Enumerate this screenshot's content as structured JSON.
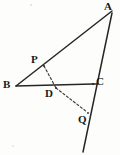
{
  "figure": {
    "kind": "geometry-diagram",
    "caption": "",
    "background_color": "#fdfdfb",
    "stroke_color": "#262626",
    "dash_color": "#3a3a3a",
    "width": 120,
    "height": 155,
    "labels": {
      "a": "A",
      "b": "B",
      "c": "C",
      "p": "P",
      "d": "D",
      "q": "Q"
    },
    "points": [
      {
        "name": "A",
        "label": "A",
        "x": 112,
        "y": 11,
        "label_x": 104,
        "label_y": 2,
        "on": "apex of triangle"
      },
      {
        "name": "B",
        "label": "B",
        "x": 16,
        "y": 86,
        "label_x": 3,
        "label_y": 79,
        "on": "left vertex of triangle"
      },
      {
        "name": "C",
        "label": "C",
        "x": 93,
        "y": 84,
        "label_x": 96,
        "label_y": 76,
        "on": "right vertex of triangle"
      },
      {
        "name": "P",
        "label": "P",
        "x": 44,
        "y": 66,
        "label_x": 30,
        "label_y": 54,
        "on": "segment AB"
      },
      {
        "name": "D",
        "label": "D",
        "x": 56,
        "y": 88,
        "label_x": 44,
        "label_y": 87,
        "on": "segment BC"
      },
      {
        "name": "Q",
        "label": "Q",
        "x": 88,
        "y": 113,
        "label_x": 78,
        "label_y": 114,
        "on": "line AC extended"
      }
    ],
    "segments": [
      {
        "name": "BA",
        "from": "B",
        "to": "A",
        "style": "solid",
        "x1": 16,
        "y1": 86,
        "x2": 112,
        "y2": 11
      },
      {
        "name": "BC",
        "from": "B",
        "to": "C",
        "style": "solid",
        "x1": 16,
        "y1": 86,
        "x2": 93,
        "y2": 84
      },
      {
        "name": "AC-extended",
        "from": "A",
        "to": "line-end",
        "style": "solid",
        "x1": 112,
        "y1": 13,
        "x2": 83,
        "y2": 152
      },
      {
        "name": "PD",
        "from": "P",
        "to": "D",
        "style": "dashed",
        "x1": 44,
        "y1": 66,
        "x2": 56,
        "y2": 88
      },
      {
        "name": "DQ",
        "from": "D",
        "to": "Q",
        "style": "dashed",
        "x1": 56,
        "y1": 88,
        "x2": 87,
        "y2": 112
      }
    ]
  }
}
